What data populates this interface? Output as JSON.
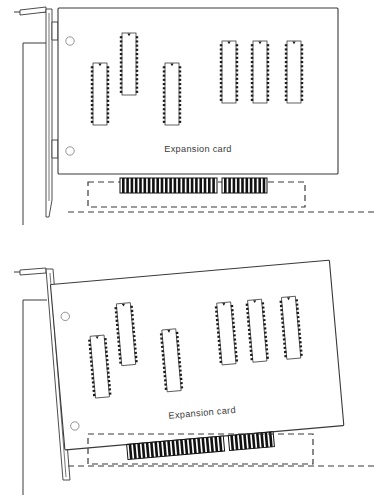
{
  "figure": {
    "background_color": "#ffffff",
    "line_color": "#3a3a3a",
    "fill_color": "#ffffff",
    "connector_color": "#111111",
    "panels": [
      {
        "id": "panel-top",
        "state": "aligned",
        "card_label": "Expansion card",
        "card": {
          "tilt_degrees": 0,
          "mounting_holes": 2,
          "chips": 6,
          "chip_pins_per_side": 14
        },
        "edge_connector": {
          "segments": 2,
          "segment_a_fingers": 22,
          "segment_b_fingers": 10
        },
        "slot": {
          "style": "dashed",
          "label": ""
        },
        "bracket": {
          "present": true,
          "tab": "top"
        },
        "chassis_wall": {
          "present": true
        }
      },
      {
        "id": "panel-bottom",
        "state": "tilted",
        "card_label": "Expansion card",
        "card": {
          "tilt_degrees": -5,
          "mounting_holes": 2,
          "chips": 6,
          "chip_pins_per_side": 14
        },
        "edge_connector": {
          "segments": 2,
          "segment_a_fingers": 22,
          "segment_b_fingers": 10
        },
        "slot": {
          "style": "dashed",
          "label": ""
        },
        "bracket": {
          "present": true,
          "tab": "top"
        },
        "chassis_wall": {
          "present": true
        }
      }
    ]
  }
}
